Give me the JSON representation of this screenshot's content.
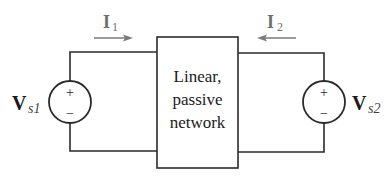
{
  "diagram": {
    "network_box": {
      "lines": [
        "Linear,",
        "passive",
        "network"
      ]
    },
    "currents": [
      {
        "symbol": "I",
        "subscript": "1",
        "direction": "right"
      },
      {
        "symbol": "I",
        "subscript": "2",
        "direction": "left"
      }
    ],
    "sources": [
      {
        "symbol": "V",
        "subscript": "s1",
        "plus": "+",
        "minus": "−",
        "side": "left"
      },
      {
        "symbol": "V",
        "subscript": "s2",
        "plus": "+",
        "minus": "−",
        "side": "right"
      }
    ],
    "colors": {
      "wire": "#2b2b2b",
      "arrow": "#7a7a7a",
      "label": "#1a1a1a",
      "current_label": "#6e6e6e"
    }
  }
}
